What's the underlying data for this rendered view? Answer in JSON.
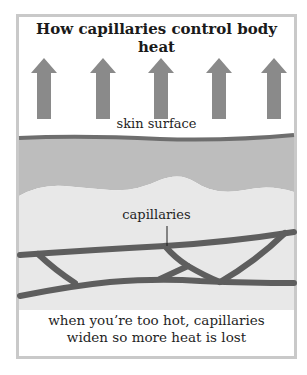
{
  "title": "How capillaries control body heat",
  "labels": {
    "skin_surface": "skin surface",
    "capillaries": "capillaries"
  },
  "caption": {
    "line1": "when you’re too hot, capillaries",
    "line2": "widen so more heat is lost"
  },
  "arrows": {
    "count": 5,
    "direction": "up",
    "meaning": "heat",
    "color": "#8a8a8a"
  },
  "colors": {
    "frame": "#c9c9c9",
    "skin_line": "#6e6e6e",
    "epidermis": "#bdbdbd",
    "dermis": "#e6e6e6",
    "vessels": "#5e5e5e"
  }
}
